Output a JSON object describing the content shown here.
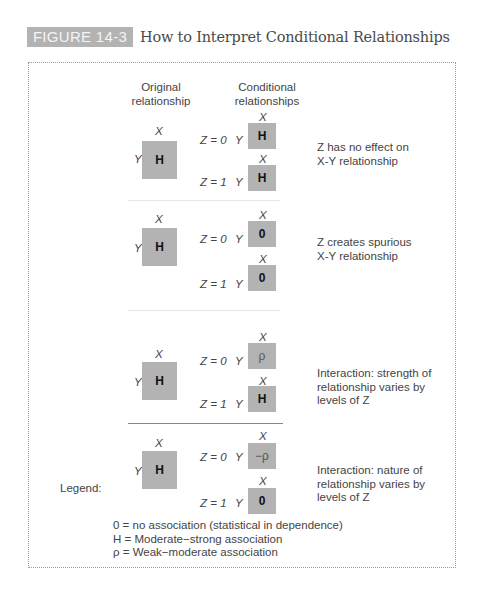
{
  "figure": {
    "badge": "FIGURE 14-3",
    "title": "How to Interpret Conditional Relationships"
  },
  "headers": {
    "original_1": "Original",
    "original_2": "relationship",
    "conditional_1": "Conditional",
    "conditional_2": "relationships"
  },
  "axis": {
    "x": "X",
    "y": "Y",
    "z0": "Z = 0",
    "z1": "Z = 1"
  },
  "rows": [
    {
      "original": "H",
      "z0": "H",
      "z1": "H",
      "desc_lines": [
        "Z has no effect on",
        "X-Y relationship"
      ]
    },
    {
      "original": "H",
      "z0": "0",
      "z1": "0",
      "desc_lines": [
        "Z  creates spurious",
        "X-Y relationship"
      ]
    },
    {
      "original": "H",
      "z0": "ρ",
      "z1": "H",
      "desc_lines": [
        "Interaction: strength of",
        "relationship varies by",
        "levels of Z"
      ]
    },
    {
      "original": "H",
      "z0": "−ρ",
      "z1": "0",
      "desc_lines": [
        "Interaction: nature of",
        "relationship varies by",
        "levels of Z"
      ]
    }
  ],
  "legend": {
    "heading": "Legend:",
    "items": [
      "0 = no association (statistical in dependence)",
      "H = Moderate−strong association",
      "ρ = Weak−moderate association"
    ]
  },
  "colors": {
    "box": "#b3b3b3",
    "badge": "#b3b3b3",
    "frame": "#9a9a9a"
  }
}
